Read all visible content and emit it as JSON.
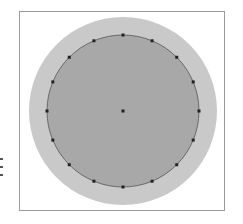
{
  "figure": {
    "type": "circle-polygon-approximation",
    "frame": {
      "x": 19,
      "y": 11,
      "width": 206,
      "height": 200,
      "stroke": "#9a9a9a"
    },
    "outer_circle": {
      "cx": 123,
      "cy": 111,
      "r": 94,
      "fill": "#c9c9c9"
    },
    "inner_circle": {
      "cx": 123,
      "cy": 111,
      "r": 76,
      "fill": "#a8a8a8",
      "stroke": "#555555"
    },
    "center_point": {
      "x": 123,
      "y": 111
    },
    "perimeter_point_count": 16,
    "point_color": "#222222",
    "point_size": 3
  }
}
